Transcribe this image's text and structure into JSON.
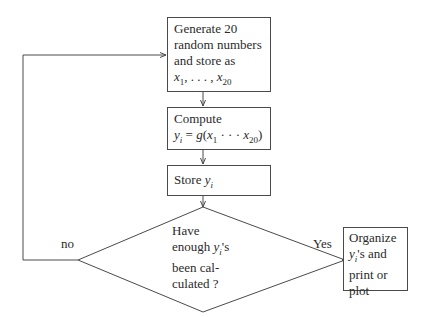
{
  "flowchart": {
    "nodes": {
      "generate": {
        "type": "process",
        "lines": [
          "Generate 20",
          "random numbers",
          "and store as"
        ],
        "math": {
          "var": "x",
          "sub1": "1",
          "sep": ", . . . , ",
          "sub2": "20"
        }
      },
      "compute": {
        "type": "process",
        "line1": "Compute",
        "math": {
          "lhs_var": "y",
          "lhs_sub": "i",
          "eq": " = ",
          "fn": "g",
          "open": "(",
          "x1_var": "x",
          "x1_sub": "1",
          "dots": " · · · ",
          "x2_var": "x",
          "x2_sub": "20",
          "close": ")"
        }
      },
      "store": {
        "type": "process",
        "text": "Store ",
        "var": "y",
        "sub": "i"
      },
      "decision": {
        "type": "decision",
        "line1": "Have",
        "line2_pre": "enough ",
        "line2_var": "y",
        "line2_sub": "i",
        "line2_post": "'s",
        "line3": "been cal-",
        "line4": "culated ?"
      },
      "organize": {
        "type": "process",
        "line1": "Organize",
        "line2_var": "y",
        "line2_sub": "i",
        "line2_post": "'s and",
        "line3": "print or",
        "line4": "plot"
      }
    },
    "edges": {
      "yes_label": "Yes",
      "no_label": "no"
    },
    "colors": {
      "line": "#4a4a4a",
      "text": "#2a2a2a",
      "background": "#ffffff"
    }
  }
}
